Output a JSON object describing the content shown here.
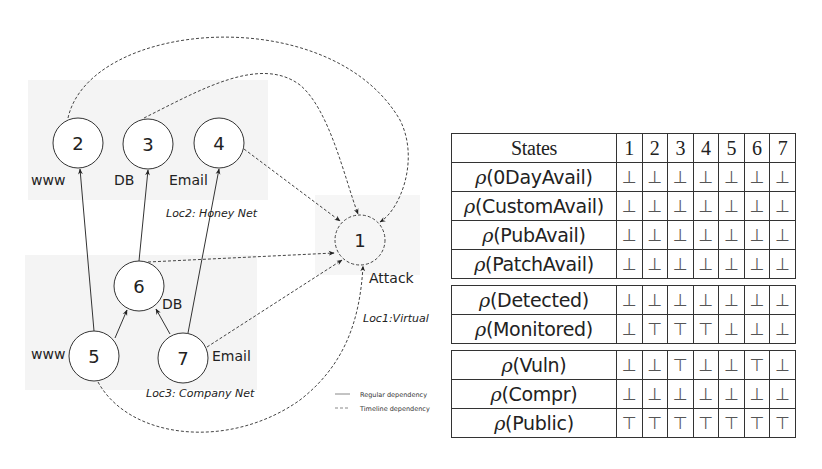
{
  "diagram": {
    "nodes": [
      {
        "id": "1",
        "label": "1",
        "role": "Attack",
        "cx": 360,
        "cy": 240,
        "dashed": true
      },
      {
        "id": "2",
        "label": "2",
        "role": "www",
        "cx": 78,
        "cy": 143,
        "dashed": false
      },
      {
        "id": "3",
        "label": "3",
        "role": "DB",
        "cx": 148,
        "cy": 144,
        "dashed": false
      },
      {
        "id": "4",
        "label": "4",
        "role": "Email",
        "cx": 219,
        "cy": 143,
        "dashed": false
      },
      {
        "id": "5",
        "label": "5",
        "role": "www",
        "cx": 94,
        "cy": 356,
        "dashed": false
      },
      {
        "id": "6",
        "label": "6",
        "role": "DB",
        "cx": 139,
        "cy": 286,
        "dashed": false
      },
      {
        "id": "7",
        "label": "7",
        "role": "Email",
        "cx": 183,
        "cy": 358,
        "dashed": false
      }
    ],
    "node_labels": {
      "n1": "Attack",
      "n2": "www",
      "n3": "DB",
      "n4": "Email",
      "n5": "www",
      "n6": "DB",
      "n7": "Email"
    },
    "locations": {
      "loc1": "Loc1:Virtual",
      "loc2": "Loc2: Honey Net",
      "loc3": "Loc3: Company Net"
    },
    "legend": {
      "regular": "Regular dependency",
      "timeline": "Timeline dependency"
    },
    "edges": [
      {
        "from": "5",
        "to": "2",
        "type": "regular"
      },
      {
        "from": "6",
        "to": "3",
        "type": "regular"
      },
      {
        "from": "7",
        "to": "4",
        "type": "regular"
      },
      {
        "from": "5",
        "to": "6",
        "type": "regular"
      },
      {
        "from": "7",
        "to": "6",
        "type": "regular"
      },
      {
        "from": "2",
        "to": "1",
        "type": "timeline"
      },
      {
        "from": "3",
        "to": "1",
        "type": "timeline"
      },
      {
        "from": "4",
        "to": "1",
        "type": "timeline"
      },
      {
        "from": "6",
        "to": "1",
        "type": "timeline"
      },
      {
        "from": "7",
        "to": "1",
        "type": "timeline"
      },
      {
        "from": "5",
        "to": "1",
        "type": "timeline"
      }
    ]
  },
  "table": {
    "header": {
      "label": "States",
      "cols": [
        "1",
        "2",
        "3",
        "4",
        "5",
        "6",
        "7"
      ]
    },
    "rho_symbol": "ρ",
    "groups": [
      {
        "rows": [
          {
            "name": "0DayAvail",
            "label": "(0DayAvail)",
            "values": [
              "⊥",
              "⊥",
              "⊥",
              "⊥",
              "⊥",
              "⊥",
              "⊥"
            ]
          },
          {
            "name": "CustomAvail",
            "label": "(CustomAvail)",
            "values": [
              "⊥",
              "⊥",
              "⊥",
              "⊥",
              "⊥",
              "⊥",
              "⊥"
            ]
          },
          {
            "name": "PubAvail",
            "label": "(PubAvail)",
            "values": [
              "⊥",
              "⊥",
              "⊥",
              "⊥",
              "⊥",
              "⊥",
              "⊥"
            ]
          },
          {
            "name": "PatchAvail",
            "label": "(PatchAvail)",
            "values": [
              "⊥",
              "⊥",
              "⊥",
              "⊥",
              "⊥",
              "⊥",
              "⊥"
            ]
          }
        ]
      },
      {
        "rows": [
          {
            "name": "Detected",
            "label": "(Detected)",
            "values": [
              "⊥",
              "⊥",
              "⊥",
              "⊥",
              "⊥",
              "⊥",
              "⊥"
            ]
          },
          {
            "name": "Monitored",
            "label": "(Monitored)",
            "values": [
              "⊥",
              "⊤",
              "⊤",
              "⊤",
              "⊥",
              "⊥",
              "⊥"
            ]
          }
        ]
      },
      {
        "rows": [
          {
            "name": "Vuln",
            "label": "(Vuln)",
            "values": [
              "⊥",
              "⊥",
              "⊤",
              "⊥",
              "⊥",
              "⊤",
              "⊥"
            ]
          },
          {
            "name": "Compr",
            "label": "(Compr)",
            "values": [
              "⊥",
              "⊥",
              "⊥",
              "⊥",
              "⊥",
              "⊥",
              "⊥"
            ]
          },
          {
            "name": "Public",
            "label": "(Public)",
            "values": [
              "⊤",
              "⊤",
              "⊤",
              "⊤",
              "⊤",
              "⊤",
              "⊤"
            ]
          }
        ]
      }
    ]
  }
}
